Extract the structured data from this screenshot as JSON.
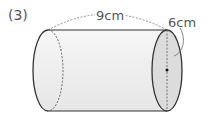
{
  "problem_number": "(3)",
  "figure": {
    "shape": "cylinder",
    "orientation": "horizontal",
    "length_label": "9cm",
    "diameter_label": "6cm"
  },
  "colors": {
    "outline": "#333333",
    "body_fill": "#efefef",
    "face_fill": "#dcdcdc",
    "dashed": "#666666",
    "text": "#555555"
  }
}
